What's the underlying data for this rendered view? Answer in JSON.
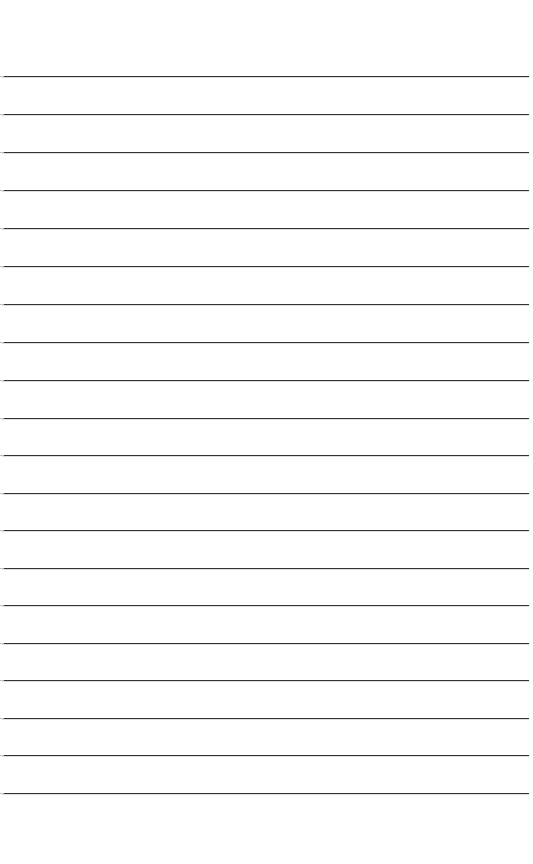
{
  "document": {
    "kind": "ruled-paper-scan",
    "title": "Blank Ruled Notebook Page",
    "page_width": 533,
    "page_height": 864,
    "background_color": "#ffffff",
    "has_text_content": false,
    "text_content": ""
  },
  "rules": {
    "count": 20,
    "color": "#2e3238",
    "thickness_px": 1.2,
    "left_x": 2,
    "right_x": 529,
    "length_px": 527,
    "first_line_y": 76,
    "last_line_y": 793,
    "spacing_px": 37.7,
    "positions": [
      76,
      114,
      152,
      190,
      228,
      266,
      304,
      342,
      380,
      418,
      455,
      493,
      530,
      568,
      605,
      643,
      680,
      718,
      755,
      793
    ]
  },
  "margins": {
    "top_margin_px": 76,
    "bottom_margin_px": 71,
    "left_margin_px": 2,
    "right_margin_px": 4
  }
}
